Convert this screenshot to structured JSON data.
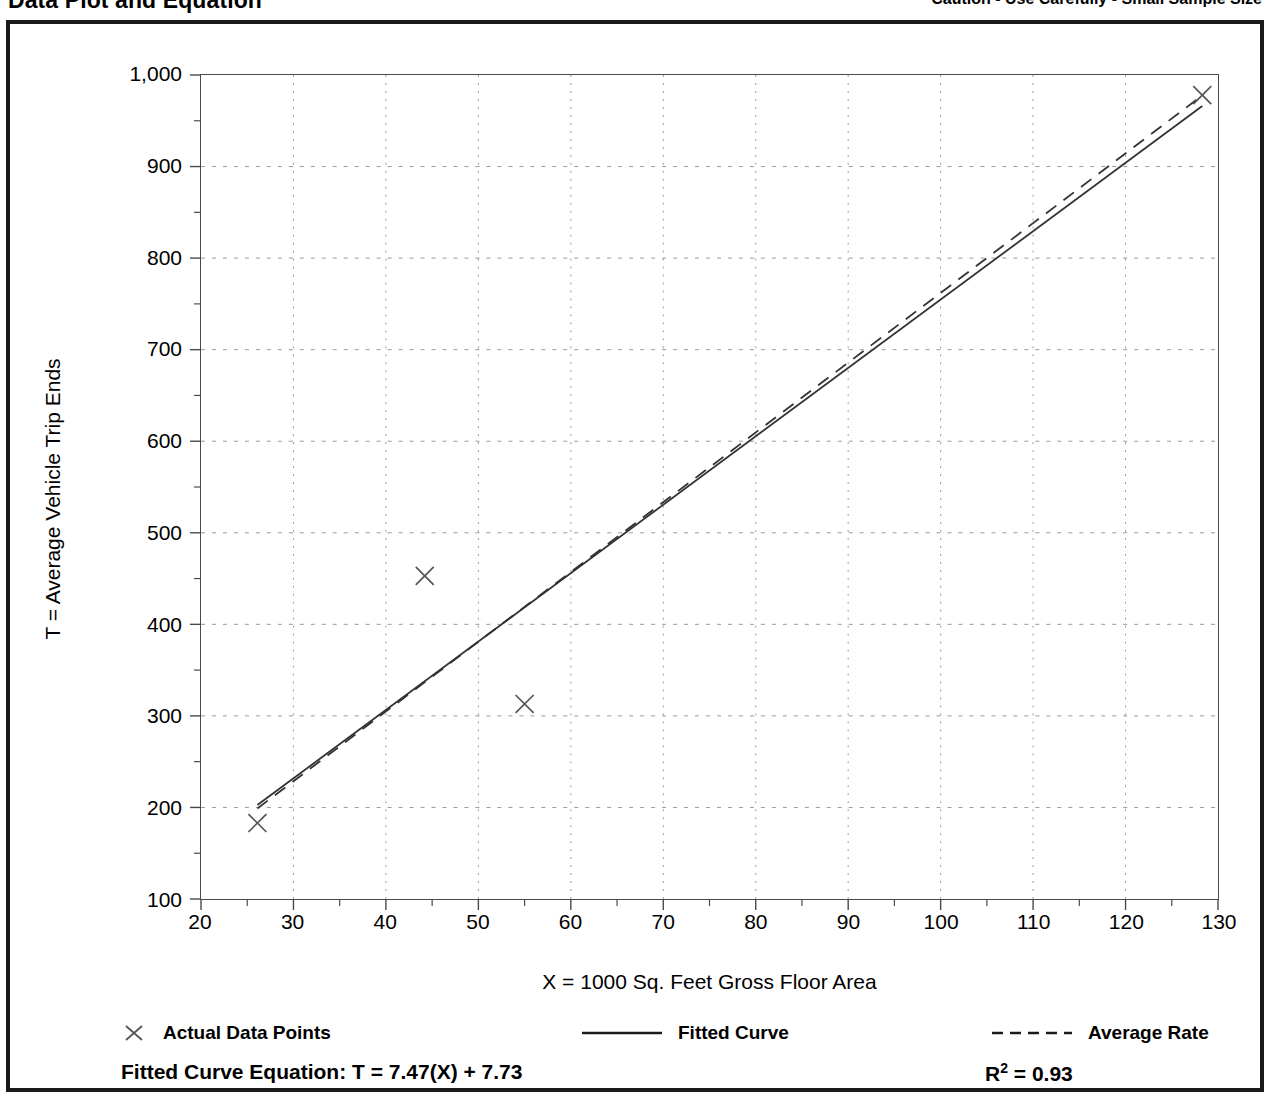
{
  "header": {
    "title": "Data Plot and Equation",
    "caution": "Caution - Use Carefully - Small Sample Size"
  },
  "legend": {
    "actual": "Actual Data Points",
    "fitted": "Fitted Curve",
    "average": "Average Rate"
  },
  "equation": {
    "fitted_label": "Fitted Curve Equation:  T = 7.47(X) + 7.73",
    "rsq_prefix": "R",
    "rsq_exponent": "2",
    "rsq_value": " = 0.93"
  },
  "colors": {
    "frame": "#1a1a1a",
    "axis": "#4a4a4a",
    "grid": "#9a9a9a",
    "series": "#333333",
    "marker": "#555555",
    "background": "#ffffff"
  },
  "chart_data": {
    "type": "scatter",
    "title": "Data Plot and Equation",
    "xlabel": "X = 1000 Sq. Feet Gross Floor Area",
    "ylabel": "T = Average Vehicle Trip Ends",
    "xlim": [
      20,
      130
    ],
    "ylim": [
      100,
      1000
    ],
    "xticks": [
      20,
      30,
      40,
      50,
      60,
      70,
      80,
      90,
      100,
      110,
      120,
      130
    ],
    "xtick_labels": [
      "20",
      "30",
      "40",
      "50",
      "60",
      "70",
      "80",
      "90",
      "100",
      "110",
      "120",
      "130"
    ],
    "yticks": [
      100,
      200,
      300,
      400,
      500,
      600,
      700,
      800,
      900,
      1000
    ],
    "ytick_labels": [
      "100",
      "200",
      "300",
      "400",
      "500",
      "600",
      "700",
      "800",
      "900",
      "1,000"
    ],
    "x_minor_step": 5,
    "y_minor_step": 50,
    "grid": true,
    "grid_style": "dotted",
    "legend_position": "below-axes",
    "points": [
      {
        "x": 26.1,
        "y": 183
      },
      {
        "x": 44.2,
        "y": 453
      },
      {
        "x": 55.0,
        "y": 313
      },
      {
        "x": 128.3,
        "y": 978
      }
    ],
    "series": [
      {
        "name": "Fitted Curve",
        "style": "solid",
        "equation": "T = 7.47(X) + 7.73",
        "slope": 7.47,
        "intercept": 7.73,
        "r_squared": 0.93,
        "x_range": [
          26.1,
          128.3
        ]
      },
      {
        "name": "Average Rate",
        "style": "dashed",
        "slope": 7.62,
        "intercept": 0,
        "x_range": [
          26.1,
          128.3
        ]
      }
    ]
  }
}
